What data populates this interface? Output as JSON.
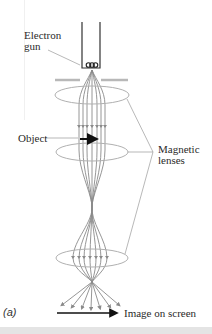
{
  "figure": {
    "panel_label": "(a)",
    "labels": {
      "electron_gun_line1": "Electron",
      "electron_gun_line2": "gun",
      "object": "Object",
      "magnetic_lenses_line1": "Magnetic",
      "magnetic_lenses_line2": "lenses",
      "image_on_screen": "Image on screen"
    },
    "colors": {
      "rays": "#8a8a8a",
      "lens": "#b0b0b0",
      "aperture": "#b8b8b8",
      "gun": "#333333",
      "arrows": "#111111",
      "leaders": "#9a9a9a",
      "text": "#2a2a2a"
    }
  }
}
